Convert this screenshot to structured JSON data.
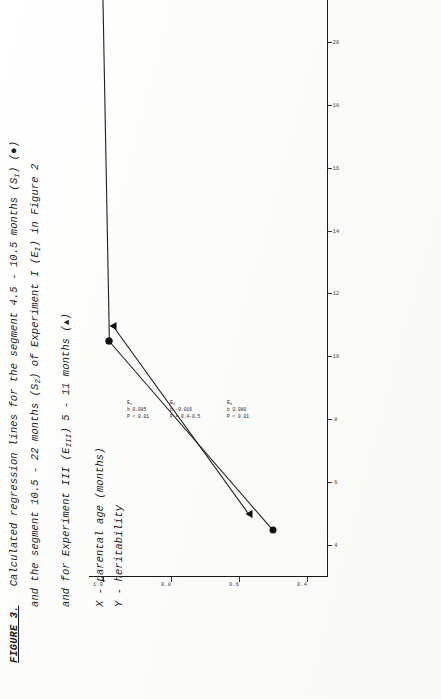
{
  "figure": {
    "label": "FIGURE 3.",
    "caption_lines": [
      "Calculated regression lines for the segment 4.5 - 10.5 months (S",
      "and the segment 10.5 - 22 months (S",
      "and for Experiment III (E",
      "X - parental age (months)",
      "Y - heritability"
    ],
    "caption_full_1": "Calculated regression lines for the segment 4.5 - 10.5 months (S1) (●)",
    "caption_full_2": "and the segment 10.5 - 22 months (S2) of Experiment I (EI) in Figure 2",
    "caption_full_3": "and for Experiment III (EIII) 5 - 11 months (▲)",
    "key_x": "X - parental age (months)",
    "key_y": "Y - heritability",
    "fragments": {
      "l1a": "Calculated regression lines for the segment 4.5 - 10.5 months (S",
      "l1b": "1",
      "l1c": ") (",
      "l1d": "●",
      "l1e": ")",
      "l2a": "and the segment 10.5 - 22 months (S",
      "l2b": "2",
      "l2c": ") of Experiment I (E",
      "l2d": "I",
      "l2e": ") in Figure 2",
      "l3a": "and for Experiment III (E",
      "l3b": "III",
      "l3c": ") 5 - 11 months (",
      "l3d": "▲",
      "l3e": ")"
    }
  },
  "chart_data": {
    "type": "line",
    "title": "",
    "xlabel": "X - parental age (months)",
    "ylabel": "Y - heritability",
    "xlim": [
      3,
      23
    ],
    "ylim": [
      0.34,
      1.04
    ],
    "xticks": [
      4,
      6,
      8,
      10,
      12,
      14,
      16,
      18,
      20,
      22
    ],
    "yticks": [
      0.4,
      0.6,
      0.8,
      1.0
    ],
    "xtick_labels": [
      "4",
      "6",
      "8",
      "10",
      "12",
      "14",
      "16",
      "18",
      "20",
      "22"
    ],
    "ytick_labels": [
      "0.4",
      "0.6",
      "0.8",
      "1.0"
    ],
    "grid": false,
    "legend": "none",
    "series": [
      {
        "name": "S1",
        "marker": "circle",
        "points": [
          [
            4.5,
            0.5
          ],
          [
            10.5,
            0.98
          ]
        ]
      },
      {
        "name": "S2",
        "marker": "circle",
        "points": [
          [
            10.5,
            0.98
          ],
          [
            22.0,
            1.0
          ]
        ]
      },
      {
        "name": "EIII",
        "marker": "triangle",
        "points": [
          [
            5.0,
            0.57
          ],
          [
            11.0,
            0.97
          ]
        ]
      }
    ]
  },
  "annotations": [
    {
      "id": "E1",
      "label": "E",
      "label_sub": "1",
      "lines": [
        "b  0.085",
        "P < 0.01"
      ],
      "b": "0.085",
      "p": "P < 0.01"
    },
    {
      "id": "E2",
      "label": "E",
      "label_sub": "2",
      "lines": [
        "b -0.016",
        "P = 0.4-0.5"
      ],
      "b": "-0.016",
      "p": "P = 0.4-0.5"
    },
    {
      "id": "E3",
      "label": "E",
      "label_sub": "3",
      "lines": [
        "b  0.080",
        "P < 0.01"
      ],
      "b": "0.080",
      "p": "P < 0.01"
    }
  ],
  "colors": {
    "ink": "#1a1a1a",
    "paper": "#fdfdfb",
    "marker": "#111111"
  }
}
